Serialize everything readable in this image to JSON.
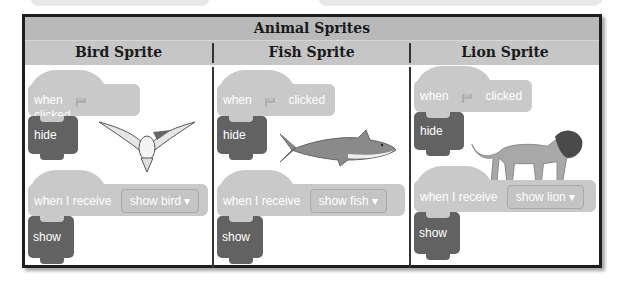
{
  "table": {
    "title": "Animal Sprites",
    "columns": [
      {
        "title": "Bird Sprite",
        "blocks": {
          "hat1_when": "when",
          "hat1_clicked": "clicked",
          "hide": "hide",
          "receive_label": "when I receive",
          "receive_value": "show bird",
          "show": "show"
        },
        "image": "bird-icon"
      },
      {
        "title": "Fish Sprite",
        "blocks": {
          "hat1_when": "when",
          "hat1_clicked": "clicked",
          "hide": "hide",
          "receive_label": "when I receive",
          "receive_value": "show fish",
          "show": "show"
        },
        "image": "shark-icon"
      },
      {
        "title": "Lion Sprite",
        "blocks": {
          "hat1_when": "when",
          "hat1_clicked": "clicked",
          "hide": "hide",
          "receive_label": "when I receive",
          "receive_value": "show lion",
          "show": "show"
        },
        "image": "lion-icon"
      }
    ]
  },
  "icons": {
    "flag": "green-flag-icon",
    "dropdown": "▾"
  },
  "colors": {
    "header": "#b9b9b9",
    "subheader": "#c6c6c6",
    "event_block": "#c9c9c9",
    "looks_block": "#626262",
    "border": "#1e1e1e"
  }
}
